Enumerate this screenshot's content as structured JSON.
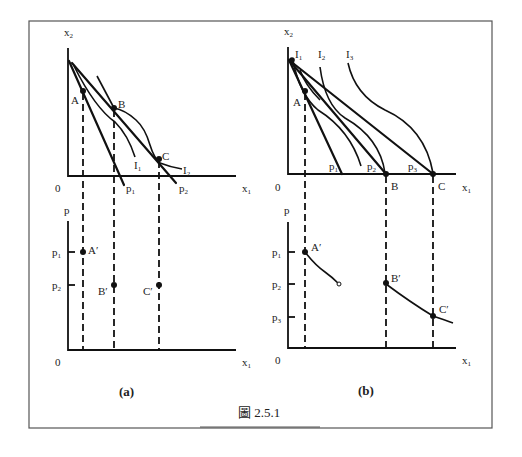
{
  "figure": {
    "caption": "圖 2.5.1",
    "panels": [
      {
        "id": "a",
        "label": "(a)",
        "top": {
          "y_axis_label": "x",
          "y_axis_sub": "2",
          "x_axis_label": "x",
          "x_axis_sub": "1",
          "origin": "0",
          "points": [
            "A",
            "B",
            "C"
          ],
          "budget_lines": [
            {
              "label": "p",
              "sub": "1"
            },
            {
              "label": "p",
              "sub": "2"
            }
          ],
          "indifference_curves": [
            {
              "label": "I",
              "sub": "1"
            },
            {
              "label": "I",
              "sub": "2"
            }
          ]
        },
        "bottom": {
          "y_axis_label": "p",
          "x_axis_label": "x",
          "x_axis_sub": "1",
          "origin": "0",
          "ticks": [
            {
              "label": "p",
              "sub": "1"
            },
            {
              "label": "p",
              "sub": "2"
            }
          ],
          "points": [
            "A′",
            "B′",
            "C′"
          ]
        }
      },
      {
        "id": "b",
        "label": "(b)",
        "top": {
          "y_axis_label": "x",
          "y_axis_sub": "2",
          "x_axis_label": "x",
          "x_axis_sub": "1",
          "origin": "0",
          "points": [
            "A",
            "B",
            "C"
          ],
          "budget_lines": [
            {
              "label": "p",
              "sub": "1"
            },
            {
              "label": "p",
              "sub": "2"
            },
            {
              "label": "p",
              "sub": "3"
            }
          ],
          "indifference_curves": [
            {
              "label": "I",
              "sub": "1"
            },
            {
              "label": "I",
              "sub": "2"
            },
            {
              "label": "I",
              "sub": "3"
            }
          ]
        },
        "bottom": {
          "y_axis_label": "p",
          "x_axis_label": "x",
          "x_axis_sub": "1",
          "origin": "0",
          "ticks": [
            {
              "label": "p",
              "sub": "1"
            },
            {
              "label": "p",
              "sub": "2"
            },
            {
              "label": "p",
              "sub": "3"
            }
          ],
          "points": [
            "A′",
            "B′",
            "C′"
          ]
        }
      }
    ]
  }
}
